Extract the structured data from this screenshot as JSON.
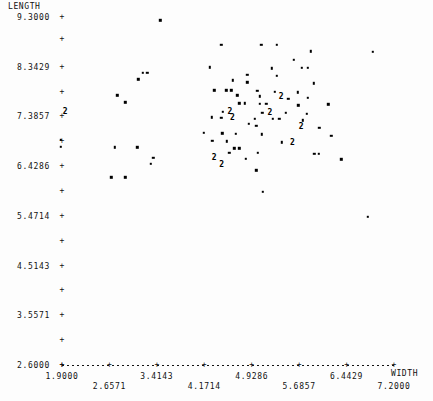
{
  "chart_data": {
    "type": "scatter",
    "title": "",
    "xlabel": "WIDTH",
    "ylabel": "LENGTH",
    "grid": false,
    "legend": null,
    "xlim": [
      1.9,
      7.2
    ],
    "ylim": [
      2.6,
      9.3
    ],
    "xticks": [
      1.9,
      2.6571,
      3.4143,
      4.1714,
      4.9286,
      5.6857,
      6.4429,
      7.2
    ],
    "xtick_labels": [
      "1.9000",
      "2.6571",
      "3.4143",
      "4.1714",
      "4.9286",
      "5.6857",
      "6.4429",
      "7.2000"
    ],
    "yticks": [
      9.3,
      8.8714,
      8.3429,
      7.8643,
      7.3857,
      6.9071,
      6.4286,
      5.95,
      5.4714,
      4.9929,
      4.5143,
      4.0357,
      3.5571,
      3.0786,
      2.6
    ],
    "ytick_labels": [
      "9.3000",
      "",
      "8.3429",
      "",
      "7.3857",
      "",
      "6.4286",
      "",
      "5.4714",
      "",
      "4.5143",
      "",
      "3.5571",
      "",
      "2.6000"
    ],
    "overplot_symbol": "2",
    "overplot_note": "digit 2 marks two coincident observations",
    "points": [
      {
        "x": 3.47,
        "y": 9.24,
        "n": 1
      },
      {
        "x": 4.44,
        "y": 8.76,
        "n": 1
      },
      {
        "x": 5.08,
        "y": 8.77,
        "n": 1
      },
      {
        "x": 5.33,
        "y": 8.77,
        "n": 1
      },
      {
        "x": 5.87,
        "y": 8.64,
        "n": 1
      },
      {
        "x": 6.86,
        "y": 8.63,
        "n": 1
      },
      {
        "x": 5.6,
        "y": 8.48,
        "n": 1
      },
      {
        "x": 4.26,
        "y": 8.33,
        "n": 1
      },
      {
        "x": 5.25,
        "y": 8.31,
        "n": 1
      },
      {
        "x": 5.73,
        "y": 8.32,
        "n": 1
      },
      {
        "x": 5.82,
        "y": 8.32,
        "n": 1
      },
      {
        "x": 3.19,
        "y": 8.22,
        "n": 1
      },
      {
        "x": 3.26,
        "y": 8.22,
        "n": 1
      },
      {
        "x": 4.86,
        "y": 8.19,
        "n": 1
      },
      {
        "x": 5.33,
        "y": 8.17,
        "n": 1
      },
      {
        "x": 3.12,
        "y": 8.1,
        "n": 1
      },
      {
        "x": 4.63,
        "y": 8.08,
        "n": 1
      },
      {
        "x": 4.86,
        "y": 8.04,
        "n": 1
      },
      {
        "x": 5.92,
        "y": 8.02,
        "n": 1
      },
      {
        "x": 4.33,
        "y": 7.89,
        "n": 1
      },
      {
        "x": 4.52,
        "y": 7.89,
        "n": 1
      },
      {
        "x": 4.6,
        "y": 7.89,
        "n": 1
      },
      {
        "x": 5.02,
        "y": 7.88,
        "n": 1
      },
      {
        "x": 5.3,
        "y": 7.86,
        "n": 1
      },
      {
        "x": 5.66,
        "y": 7.85,
        "n": 1
      },
      {
        "x": 2.78,
        "y": 7.79,
        "n": 1
      },
      {
        "x": 4.7,
        "y": 7.79,
        "n": 1
      },
      {
        "x": 5.06,
        "y": 7.77,
        "n": 1
      },
      {
        "x": 5.4,
        "y": 7.76,
        "n": 2
      },
      {
        "x": 5.82,
        "y": 7.74,
        "n": 1
      },
      {
        "x": 5.51,
        "y": 7.72,
        "n": 1
      },
      {
        "x": 2.91,
        "y": 7.66,
        "n": 1
      },
      {
        "x": 4.73,
        "y": 7.64,
        "n": 1
      },
      {
        "x": 4.82,
        "y": 7.64,
        "n": 1
      },
      {
        "x": 5.06,
        "y": 7.63,
        "n": 1
      },
      {
        "x": 5.16,
        "y": 7.63,
        "n": 1
      },
      {
        "x": 6.15,
        "y": 7.62,
        "n": 1
      },
      {
        "x": 5.67,
        "y": 7.6,
        "n": 1
      },
      {
        "x": 1.95,
        "y": 7.48,
        "n": 2
      },
      {
        "x": 4.47,
        "y": 7.48,
        "n": 1
      },
      {
        "x": 4.58,
        "y": 7.47,
        "n": 2
      },
      {
        "x": 5.1,
        "y": 7.46,
        "n": 1
      },
      {
        "x": 5.22,
        "y": 7.46,
        "n": 2
      },
      {
        "x": 5.47,
        "y": 7.45,
        "n": 1
      },
      {
        "x": 5.81,
        "y": 7.44,
        "n": 1
      },
      {
        "x": 4.29,
        "y": 7.37,
        "n": 1
      },
      {
        "x": 4.44,
        "y": 7.36,
        "n": 1
      },
      {
        "x": 4.62,
        "y": 7.36,
        "n": 2
      },
      {
        "x": 4.98,
        "y": 7.34,
        "n": 1
      },
      {
        "x": 5.27,
        "y": 7.34,
        "n": 1
      },
      {
        "x": 5.37,
        "y": 7.34,
        "n": 1
      },
      {
        "x": 5.74,
        "y": 7.31,
        "n": 1
      },
      {
        "x": 4.88,
        "y": 7.24,
        "n": 1
      },
      {
        "x": 5.0,
        "y": 7.2,
        "n": 1
      },
      {
        "x": 5.72,
        "y": 7.18,
        "n": 2
      },
      {
        "x": 6.01,
        "y": 7.17,
        "n": 1
      },
      {
        "x": 4.16,
        "y": 7.07,
        "n": 1
      },
      {
        "x": 4.46,
        "y": 7.06,
        "n": 1
      },
      {
        "x": 4.67,
        "y": 7.05,
        "n": 1
      },
      {
        "x": 5.09,
        "y": 7.04,
        "n": 1
      },
      {
        "x": 6.2,
        "y": 7.01,
        "n": 1
      },
      {
        "x": 1.88,
        "y": 6.94,
        "n": 1
      },
      {
        "x": 4.3,
        "y": 6.92,
        "n": 1
      },
      {
        "x": 4.53,
        "y": 6.91,
        "n": 1
      },
      {
        "x": 5.41,
        "y": 6.89,
        "n": 1
      },
      {
        "x": 5.58,
        "y": 6.88,
        "n": 2
      },
      {
        "x": 1.88,
        "y": 6.8,
        "n": 1
      },
      {
        "x": 2.74,
        "y": 6.79,
        "n": 1
      },
      {
        "x": 3.1,
        "y": 6.79,
        "n": 1
      },
      {
        "x": 4.65,
        "y": 6.77,
        "n": 1
      },
      {
        "x": 4.73,
        "y": 6.77,
        "n": 1
      },
      {
        "x": 4.57,
        "y": 6.69,
        "n": 1
      },
      {
        "x": 5.03,
        "y": 6.68,
        "n": 1
      },
      {
        "x": 5.93,
        "y": 6.67,
        "n": 1
      },
      {
        "x": 6.0,
        "y": 6.67,
        "n": 1
      },
      {
        "x": 3.36,
        "y": 6.59,
        "n": 1
      },
      {
        "x": 4.33,
        "y": 6.58,
        "n": 2
      },
      {
        "x": 4.83,
        "y": 6.57,
        "n": 1
      },
      {
        "x": 6.36,
        "y": 6.56,
        "n": 1
      },
      {
        "x": 3.32,
        "y": 6.47,
        "n": 1
      },
      {
        "x": 4.45,
        "y": 6.46,
        "n": 2
      },
      {
        "x": 5.0,
        "y": 6.35,
        "n": 1
      },
      {
        "x": 2.69,
        "y": 6.21,
        "n": 1
      },
      {
        "x": 2.91,
        "y": 6.21,
        "n": 1
      },
      {
        "x": 5.11,
        "y": 5.93,
        "n": 1
      },
      {
        "x": 6.78,
        "y": 5.45,
        "n": 1
      }
    ]
  },
  "axes": {
    "y_title": "LENGTH",
    "x_title": "WIDTH"
  }
}
